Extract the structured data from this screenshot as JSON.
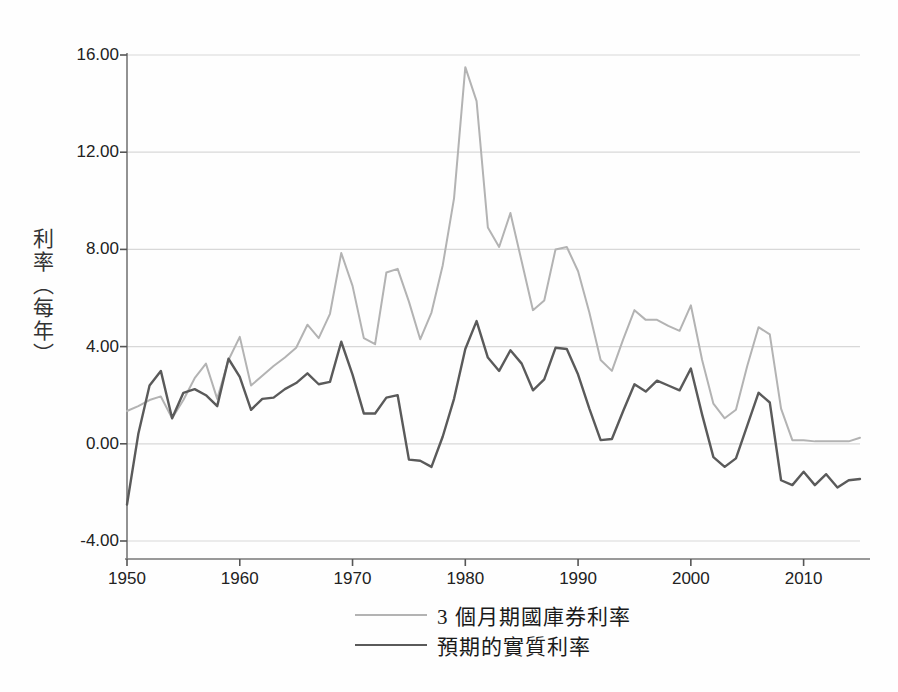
{
  "chart_data": {
    "type": "line",
    "title": "",
    "xlabel": "",
    "ylabel": "利率（每年）",
    "xlim": [
      1950,
      2015
    ],
    "ylim": [
      -4.0,
      16.0
    ],
    "grid": true,
    "legend_position": "bottom",
    "yticks": [
      "16.00",
      "12.00",
      "8.00",
      "4.00",
      "0.00",
      "-4.00"
    ],
    "ytick_values": [
      16,
      12,
      8,
      4,
      0,
      -4
    ],
    "xticks": [
      "1950",
      "1960",
      "1970",
      "1980",
      "1990",
      "2000",
      "2010"
    ],
    "xtick_values": [
      1950,
      1960,
      1970,
      1980,
      1990,
      2000,
      2010
    ],
    "x": [
      1950,
      1951,
      1952,
      1953,
      1954,
      1955,
      1956,
      1957,
      1958,
      1959,
      1960,
      1961,
      1962,
      1963,
      1964,
      1965,
      1966,
      1967,
      1968,
      1969,
      1970,
      1971,
      1972,
      1973,
      1974,
      1975,
      1976,
      1977,
      1978,
      1979,
      1980,
      1981,
      1982,
      1983,
      1984,
      1985,
      1986,
      1987,
      1988,
      1989,
      1990,
      1991,
      1992,
      1993,
      1994,
      1995,
      1996,
      1997,
      1998,
      1999,
      2000,
      2001,
      2002,
      2003,
      2004,
      2005,
      2006,
      2007,
      2008,
      2009,
      2010,
      2011,
      2012,
      2013,
      2014,
      2015
    ],
    "series": [
      {
        "name": "3 個月期國庫券利率",
        "color": "#b3b3b3",
        "values": [
          1.35,
          1.55,
          1.8,
          1.95,
          1.05,
          1.8,
          2.7,
          3.3,
          1.85,
          3.45,
          4.4,
          2.4,
          2.8,
          3.2,
          3.55,
          3.95,
          4.9,
          4.35,
          5.35,
          7.85,
          6.5,
          4.35,
          4.1,
          7.05,
          7.2,
          5.85,
          4.3,
          5.4,
          7.35,
          10.1,
          15.5,
          14.1,
          8.9,
          8.1,
          9.5,
          7.5,
          5.5,
          5.9,
          8.0,
          8.1,
          7.1,
          5.4,
          3.45,
          3.0,
          4.3,
          5.5,
          5.1,
          5.1,
          4.85,
          4.65,
          5.7,
          3.45,
          1.65,
          1.05,
          1.4,
          3.2,
          4.8,
          4.5,
          1.45,
          0.15,
          0.15,
          0.1,
          0.1,
          0.1,
          0.1,
          0.25
        ]
      },
      {
        "name": "預期的實質利率",
        "color": "#5a5a5a",
        "values": [
          -2.5,
          0.4,
          2.4,
          3.0,
          1.05,
          2.1,
          2.25,
          2.0,
          1.55,
          3.5,
          2.75,
          1.4,
          1.85,
          1.9,
          2.25,
          2.5,
          2.9,
          2.45,
          2.55,
          4.2,
          2.85,
          1.25,
          1.25,
          1.9,
          2.0,
          -0.65,
          -0.7,
          -0.95,
          0.3,
          1.85,
          3.9,
          5.05,
          3.55,
          3.0,
          3.85,
          3.3,
          2.2,
          2.65,
          3.95,
          3.9,
          2.85,
          1.45,
          0.15,
          0.2,
          1.35,
          2.45,
          2.15,
          2.6,
          2.4,
          2.2,
          3.1,
          1.2,
          -0.55,
          -0.95,
          -0.6,
          0.75,
          2.1,
          1.7,
          -1.5,
          -1.7,
          -1.15,
          -1.7,
          -1.25,
          -1.8,
          -1.5,
          -1.45
        ]
      }
    ]
  },
  "legend": {
    "items": [
      {
        "label": "3 個月期國庫券利率",
        "color": "#b3b3b3"
      },
      {
        "label": "預期的實質利率",
        "color": "#5a5a5a"
      }
    ]
  },
  "axes": {
    "y_title": "利率（每年）"
  }
}
